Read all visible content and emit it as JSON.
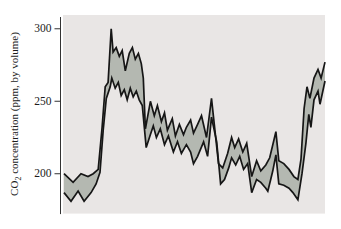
{
  "figure": {
    "kind": "scientific line-band chart",
    "caption_visible_text": ""
  },
  "chart_data": {
    "type": "area",
    "subtype": "band-between-two-lines",
    "title": "",
    "xlabel": "",
    "ylabel": "CO2 concentration (ppm, by volume)",
    "ylabel_parts": {
      "pre": "CO",
      "sub": "2",
      "post": " concentration (ppm, by volume)"
    },
    "yticks": [
      300,
      250,
      200
    ],
    "ytick_labels": [
      "300",
      "250",
      "200"
    ],
    "ylim": [
      172.5,
      309.5
    ],
    "x_axis_note": "no x-axis line, ticks or labels shown; x stored as percent of plot width (0-100)",
    "grid": false,
    "legend": false,
    "series": [
      {
        "name": "upper bound",
        "points": [
          [
            0,
            200
          ],
          [
            3.5,
            194
          ],
          [
            6.5,
            200
          ],
          [
            9.2,
            198
          ],
          [
            11.2,
            200
          ],
          [
            13.1,
            203
          ],
          [
            14.6,
            232
          ],
          [
            15.8,
            260
          ],
          [
            16.9,
            263
          ],
          [
            18.1,
            300
          ],
          [
            18.8,
            284
          ],
          [
            20,
            287
          ],
          [
            21.2,
            281
          ],
          [
            22.3,
            285
          ],
          [
            23.5,
            271
          ],
          [
            25,
            283
          ],
          [
            26.2,
            287
          ],
          [
            27.3,
            279
          ],
          [
            28.5,
            283
          ],
          [
            29.6,
            276
          ],
          [
            30.4,
            266
          ],
          [
            31.2,
            231
          ],
          [
            33.1,
            250
          ],
          [
            34.6,
            240
          ],
          [
            35.8,
            247
          ],
          [
            37.3,
            236
          ],
          [
            38.5,
            242
          ],
          [
            39.6,
            230
          ],
          [
            41.5,
            238
          ],
          [
            42.7,
            226
          ],
          [
            44.2,
            234
          ],
          [
            45.8,
            227
          ],
          [
            46.9,
            232
          ],
          [
            48.5,
            237
          ],
          [
            49.6,
            228
          ],
          [
            51.2,
            234
          ],
          [
            52.7,
            240
          ],
          [
            54.6,
            225
          ],
          [
            56.5,
            252
          ],
          [
            59.2,
            207
          ],
          [
            60.8,
            204
          ],
          [
            62.7,
            214
          ],
          [
            64.2,
            225
          ],
          [
            65.4,
            218
          ],
          [
            66.9,
            224
          ],
          [
            68.5,
            215
          ],
          [
            70,
            221
          ],
          [
            71.9,
            198
          ],
          [
            73.8,
            209
          ],
          [
            75.4,
            202
          ],
          [
            77.3,
            206
          ],
          [
            78.8,
            211
          ],
          [
            81.2,
            229
          ],
          [
            82.3,
            209
          ],
          [
            84.2,
            207
          ],
          [
            86.2,
            203
          ],
          [
            88.1,
            198
          ],
          [
            89.6,
            196
          ],
          [
            90.8,
            210
          ],
          [
            92,
            245
          ],
          [
            93.1,
            260
          ],
          [
            94.2,
            252
          ],
          [
            95.8,
            266
          ],
          [
            97.3,
            272
          ],
          [
            98.5,
            266
          ],
          [
            100,
            277
          ]
        ]
      },
      {
        "name": "lower bound",
        "points": [
          [
            0,
            187
          ],
          [
            2.7,
            181
          ],
          [
            5.4,
            188
          ],
          [
            7.7,
            181
          ],
          [
            10.4,
            187
          ],
          [
            12.3,
            193
          ],
          [
            13.8,
            201
          ],
          [
            15,
            230
          ],
          [
            16.2,
            252
          ],
          [
            17.7,
            260
          ],
          [
            18.3,
            266
          ],
          [
            19.6,
            259
          ],
          [
            20.8,
            263
          ],
          [
            21.9,
            254
          ],
          [
            23.1,
            258
          ],
          [
            24.2,
            251
          ],
          [
            25.4,
            259
          ],
          [
            26.5,
            253
          ],
          [
            27.7,
            257
          ],
          [
            28.8,
            251
          ],
          [
            30,
            247
          ],
          [
            31.5,
            218
          ],
          [
            33.1,
            227
          ],
          [
            34.2,
            233
          ],
          [
            35.4,
            225
          ],
          [
            36.9,
            231
          ],
          [
            38.5,
            220
          ],
          [
            40,
            226
          ],
          [
            41.9,
            215
          ],
          [
            43.5,
            222
          ],
          [
            45,
            214
          ],
          [
            46.9,
            220
          ],
          [
            48.5,
            215
          ],
          [
            49.6,
            207
          ],
          [
            51.2,
            212
          ],
          [
            53.5,
            222
          ],
          [
            55,
            212
          ],
          [
            56.5,
            239
          ],
          [
            58.5,
            222
          ],
          [
            60,
            193
          ],
          [
            61.5,
            196
          ],
          [
            63.1,
            204
          ],
          [
            64.2,
            211
          ],
          [
            65.8,
            206
          ],
          [
            67.3,
            212
          ],
          [
            68.8,
            203
          ],
          [
            70.4,
            207
          ],
          [
            71.9,
            187
          ],
          [
            73.8,
            196
          ],
          [
            75.4,
            194
          ],
          [
            77.3,
            190
          ],
          [
            78.1,
            188
          ],
          [
            79.2,
            196
          ],
          [
            80,
            202
          ],
          [
            81.2,
            213
          ],
          [
            82.3,
            193
          ],
          [
            84.2,
            192
          ],
          [
            86.2,
            190
          ],
          [
            87.7,
            187
          ],
          [
            89.6,
            182
          ],
          [
            91.2,
            200
          ],
          [
            92.7,
            221
          ],
          [
            93.8,
            241
          ],
          [
            94.6,
            232
          ],
          [
            95.8,
            251
          ],
          [
            97.3,
            257
          ],
          [
            98.1,
            248
          ],
          [
            100,
            264
          ]
        ]
      }
    ],
    "colors": {
      "plot_bg": "#e9e6e5",
      "band_fill": "#b4b8b1",
      "line": "#161616",
      "axis": "#333333",
      "tick_text": "#1c1c1c",
      "page_bg": "#ffffff"
    }
  }
}
